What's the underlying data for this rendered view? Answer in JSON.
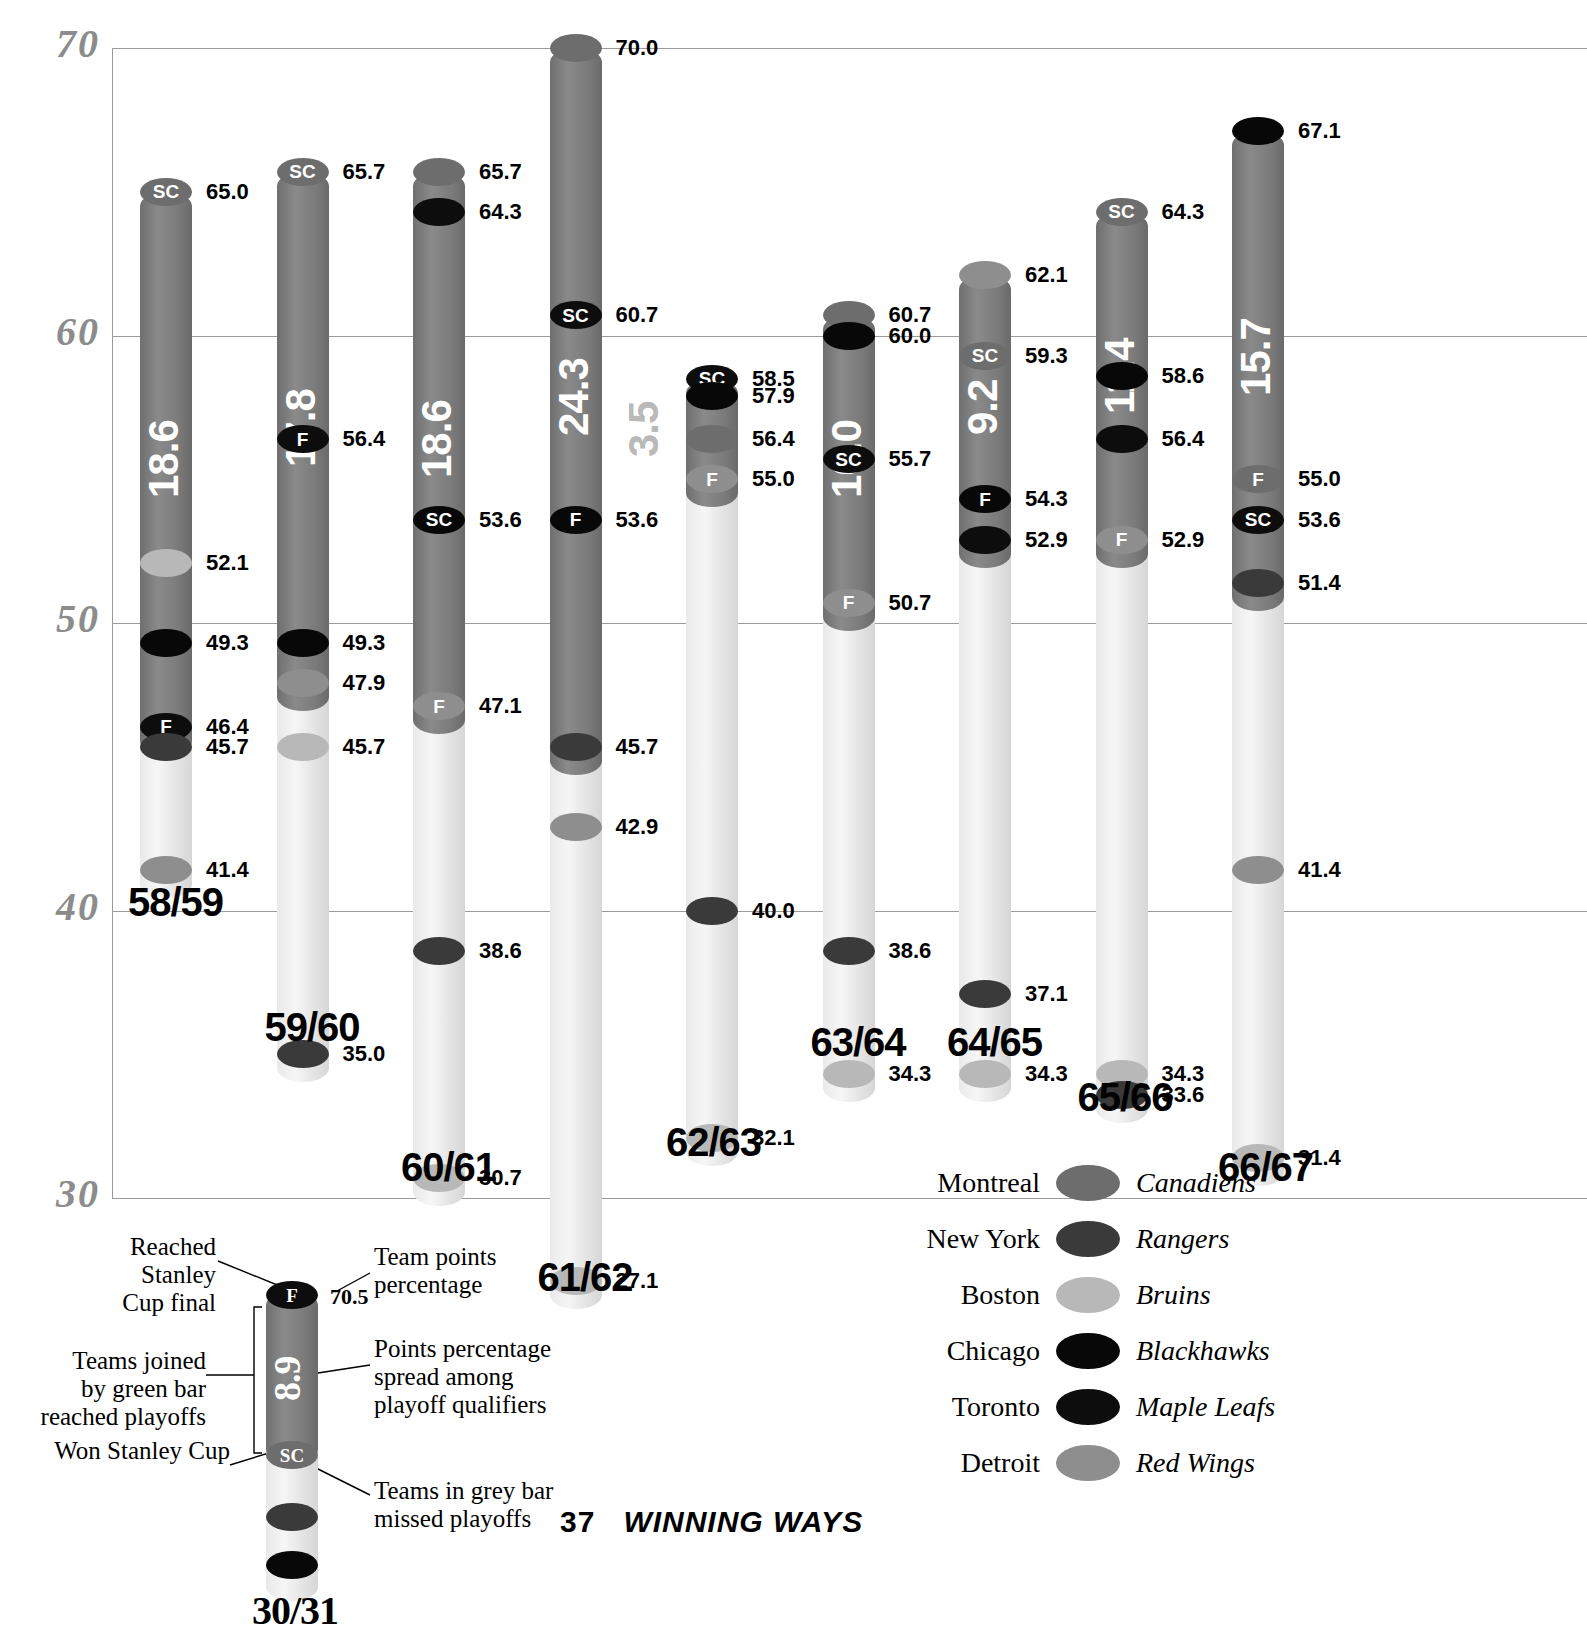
{
  "chart_data": {
    "type": "bar",
    "title": "",
    "xlabel": "",
    "ylabel": "Team points percentage",
    "ylim": [
      30,
      70
    ],
    "yticks": [
      30,
      40,
      50,
      60,
      70
    ],
    "grid": true,
    "legend_position": "bottom-right",
    "annotations": {
      "spread_label": "Points percentage spread among playoff qualifiers",
      "value_label": "Team points percentage"
    },
    "series": [
      {
        "season": "58/59",
        "spread": "18.6",
        "spread_inside": true,
        "top": 65.0,
        "bottom": 41.4,
        "green_top": 65.0,
        "green_bottom": 46.4,
        "teams": [
          {
            "value": "65.0",
            "team": "montreal",
            "marker": "SC"
          },
          {
            "value": "52.1",
            "team": "bruins",
            "marker": ""
          },
          {
            "value": "49.3",
            "team": "blackhawks",
            "marker": ""
          },
          {
            "value": "46.4",
            "team": "mapleleafs",
            "marker": "F"
          },
          {
            "value": "45.7",
            "team": "rangers",
            "marker": ""
          },
          {
            "value": "41.4",
            "team": "redwings",
            "marker": ""
          }
        ]
      },
      {
        "season": "59/60",
        "spread": "17.8",
        "spread_inside": true,
        "top": 65.7,
        "bottom": 35.0,
        "green_top": 65.7,
        "green_bottom": 47.9,
        "teams": [
          {
            "value": "65.7",
            "team": "montreal",
            "marker": "SC"
          },
          {
            "value": "56.4",
            "team": "mapleleafs",
            "marker": "F"
          },
          {
            "value": "49.3",
            "team": "blackhawks",
            "marker": ""
          },
          {
            "value": "47.9",
            "team": "redwings",
            "marker": ""
          },
          {
            "value": "45.7",
            "team": "bruins",
            "marker": ""
          },
          {
            "value": "35.0",
            "team": "rangers",
            "marker": ""
          }
        ]
      },
      {
        "season": "60/61",
        "spread": "18.6",
        "spread_inside": true,
        "top": 65.7,
        "bottom": 30.7,
        "green_top": 65.7,
        "green_bottom": 47.1,
        "teams": [
          {
            "value": "65.7",
            "team": "montreal",
            "marker": ""
          },
          {
            "value": "64.3",
            "team": "mapleleafs",
            "marker": ""
          },
          {
            "value": "53.6",
            "team": "blackhawks",
            "marker": "SC"
          },
          {
            "value": "47.1",
            "team": "redwings",
            "marker": "F"
          },
          {
            "value": "38.6",
            "team": "rangers",
            "marker": ""
          },
          {
            "value": "30.7",
            "team": "bruins",
            "marker": ""
          }
        ]
      },
      {
        "season": "61/62",
        "spread": "24.3",
        "spread_inside": true,
        "top": 70.0,
        "bottom": 27.1,
        "green_top": 70.0,
        "green_bottom": 45.7,
        "teams": [
          {
            "value": "70.0",
            "team": "montreal",
            "marker": ""
          },
          {
            "value": "60.7",
            "team": "mapleleafs",
            "marker": "SC"
          },
          {
            "value": "53.6",
            "team": "blackhawks",
            "marker": "F"
          },
          {
            "value": "45.7",
            "team": "rangers",
            "marker": ""
          },
          {
            "value": "42.9",
            "team": "redwings",
            "marker": ""
          },
          {
            "value": "27.1",
            "team": "bruins",
            "marker": ""
          }
        ]
      },
      {
        "season": "62/63",
        "spread": "3.5",
        "spread_inside": false,
        "top": 58.5,
        "bottom": 32.1,
        "green_top": 58.5,
        "green_bottom": 55.0,
        "teams": [
          {
            "value": "58.5",
            "team": "mapleleafs",
            "marker": "SC"
          },
          {
            "value": "57.9",
            "team": "blackhawks",
            "marker": ""
          },
          {
            "value": "56.4",
            "team": "montreal",
            "marker": ""
          },
          {
            "value": "55.0",
            "team": "redwings",
            "marker": "F"
          },
          {
            "value": "40.0",
            "team": "rangers",
            "marker": ""
          },
          {
            "value": "32.1",
            "team": "bruins",
            "marker": ""
          }
        ]
      },
      {
        "season": "63/64",
        "spread": "10.0",
        "spread_inside": true,
        "top": 60.7,
        "bottom": 34.3,
        "green_top": 60.7,
        "green_bottom": 50.7,
        "teams": [
          {
            "value": "60.7",
            "team": "montreal",
            "marker": ""
          },
          {
            "value": "60.0",
            "team": "blackhawks",
            "marker": ""
          },
          {
            "value": "55.7",
            "team": "mapleleafs",
            "marker": "SC"
          },
          {
            "value": "50.7",
            "team": "redwings",
            "marker": "F"
          },
          {
            "value": "38.6",
            "team": "rangers",
            "marker": ""
          },
          {
            "value": "34.3",
            "team": "bruins",
            "marker": ""
          }
        ]
      },
      {
        "season": "64/65",
        "spread": "9.2",
        "spread_inside": true,
        "top": 62.1,
        "bottom": 34.3,
        "green_top": 62.1,
        "green_bottom": 52.9,
        "teams": [
          {
            "value": "62.1",
            "team": "redwings",
            "marker": ""
          },
          {
            "value": "59.3",
            "team": "montreal",
            "marker": "SC"
          },
          {
            "value": "54.3",
            "team": "blackhawks",
            "marker": "F"
          },
          {
            "value": "52.9",
            "team": "mapleleafs",
            "marker": ""
          },
          {
            "value": "37.1",
            "team": "rangers",
            "marker": ""
          },
          {
            "value": "34.3",
            "team": "bruins",
            "marker": ""
          }
        ]
      },
      {
        "season": "65/66",
        "spread": "11.4",
        "spread_inside": true,
        "top": 64.3,
        "bottom": 33.6,
        "green_top": 64.3,
        "green_bottom": 52.9,
        "teams": [
          {
            "value": "64.3",
            "team": "montreal",
            "marker": "SC"
          },
          {
            "value": "58.6",
            "team": "blackhawks",
            "marker": ""
          },
          {
            "value": "56.4",
            "team": "mapleleafs",
            "marker": ""
          },
          {
            "value": "52.9",
            "team": "redwings",
            "marker": "F"
          },
          {
            "value": "34.3",
            "team": "bruins",
            "marker": ""
          },
          {
            "value": "33.6",
            "team": "rangers",
            "marker": ""
          }
        ]
      },
      {
        "season": "66/67",
        "spread": "15.7",
        "spread_inside": true,
        "top": 67.1,
        "bottom": 31.4,
        "green_top": 67.1,
        "green_bottom": 51.4,
        "teams": [
          {
            "value": "67.1",
            "team": "blackhawks",
            "marker": ""
          },
          {
            "value": "55.0",
            "team": "montreal",
            "marker": "F"
          },
          {
            "value": "53.6",
            "team": "mapleleafs",
            "marker": "SC"
          },
          {
            "value": "51.4",
            "team": "rangers",
            "marker": ""
          },
          {
            "value": "41.4",
            "team": "redwings",
            "marker": ""
          },
          {
            "value": "31.4",
            "team": "bruins",
            "marker": ""
          }
        ]
      }
    ]
  },
  "key_diagram": {
    "season": "30/31",
    "spread": "8.9",
    "value": "70.5",
    "labels": {
      "reached_final": "Reached\nStanley\nCup final",
      "joined_green": "Teams joined\nby green bar\nreached playoffs",
      "won_cup": "Won Stanley Cup",
      "team_points": "Team points\npercentage",
      "spread_note": "Points percentage\nspread among\nplayoff qualifiers",
      "grey_note": "Teams in grey bar\nmissed playoffs"
    },
    "markers": {
      "final": "F",
      "cup": "SC"
    }
  },
  "team_key": {
    "rows": [
      {
        "city": "Montreal",
        "nickname": "Canadiens",
        "color": "#6d6d6d",
        "key": "montreal"
      },
      {
        "city": "New York",
        "nickname": "Rangers",
        "color": "#3a3a3a",
        "key": "rangers"
      },
      {
        "city": "Boston",
        "nickname": "Bruins",
        "color": "#b8b8b8",
        "key": "bruins"
      },
      {
        "city": "Chicago",
        "nickname": "Blackhawks",
        "color": "#080808",
        "key": "blackhawks"
      },
      {
        "city": "Toronto",
        "nickname": "Maple Leafs",
        "color": "#0d0d0d",
        "key": "mapleleafs"
      },
      {
        "city": "Detroit",
        "nickname": "Red Wings",
        "color": "#8e8e8e",
        "key": "redwings"
      }
    ]
  },
  "footer": {
    "page": "37",
    "book": "WINNING WAYS"
  },
  "colors": {
    "grid": "#9a9a9a",
    "ytick": "#8c8c8c",
    "green_bar": "#7a7a7a",
    "grey_bar": "#e6e6e6"
  }
}
